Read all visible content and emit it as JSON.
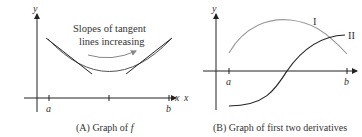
{
  "panel_a": {
    "caption_prefix": "(A) Graph of ",
    "caption_var": "f",
    "y_label": "y",
    "x_label": "x",
    "tick_a": "a",
    "tick_b": "b",
    "annotation_line1": "Slopes of tangent",
    "annotation_line2": "lines increasing",
    "colors": {
      "curve": "#555555",
      "tangent": "#222222",
      "axis": "#222222",
      "arrow": "#777777"
    }
  },
  "panel_b": {
    "caption": "(B) Graph of first two derivatives",
    "y_label": "y",
    "x_label": "x",
    "tick_a": "a",
    "tick_b": "b",
    "curve_I_label": "I",
    "curve_II_label": "II",
    "colors": {
      "curve_I": "#9a9a9a",
      "curve_II": "#222222",
      "axis": "#222222"
    }
  }
}
